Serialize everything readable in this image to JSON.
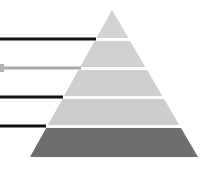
{
  "diagram": {
    "type": "pyramid",
    "apex": [
      112,
      10
    ],
    "base_left": [
      30,
      157
    ],
    "base_right": [
      198,
      157
    ],
    "gap_px": 3,
    "layers": [
      {
        "index": 0,
        "y_top": 10,
        "y_bottom": 38,
        "color": "#d2d2d2",
        "label": ""
      },
      {
        "index": 1,
        "y_top": 41,
        "y_bottom": 67,
        "color": "#d0d0d0",
        "label": ""
      },
      {
        "index": 2,
        "y_top": 70,
        "y_bottom": 96,
        "color": "#cfcfcf",
        "label": ""
      },
      {
        "index": 3,
        "y_top": 99,
        "y_bottom": 125,
        "color": "#cdcdcd",
        "label": ""
      },
      {
        "index": 4,
        "y_top": 128,
        "y_bottom": 157,
        "color": "#6e6e6e",
        "label": ""
      }
    ],
    "connectors": [
      {
        "layer": 0,
        "y": 39,
        "x_start": 0,
        "x_end": 96,
        "color": "#111111",
        "width": 3,
        "marker": false
      },
      {
        "layer": 1,
        "y": 68,
        "x_start": 0,
        "x_end": 81,
        "color": "#aaaaaa",
        "width": 3,
        "marker": true,
        "marker_color": "#b5b5b5"
      },
      {
        "layer": 2,
        "y": 97,
        "x_start": 0,
        "x_end": 63,
        "color": "#111111",
        "width": 3,
        "marker": false
      },
      {
        "layer": 3,
        "y": 126,
        "x_start": 0,
        "x_end": 46,
        "color": "#111111",
        "width": 3,
        "marker": false
      }
    ]
  }
}
